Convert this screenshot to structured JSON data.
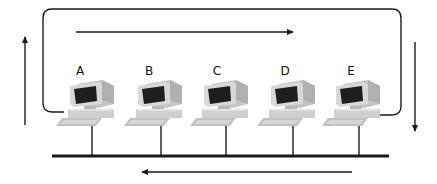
{
  "diagram": {
    "type": "token-ring-over-bus",
    "nodes": [
      {
        "label": "A",
        "cx": 92
      },
      {
        "label": "B",
        "cx": 160
      },
      {
        "label": "C",
        "cx": 226
      },
      {
        "label": "D",
        "cx": 293
      },
      {
        "label": "E",
        "cx": 358
      }
    ],
    "arrows": {
      "top": "right",
      "right": "down",
      "bottom": "left",
      "left": "up"
    },
    "colors": {
      "line": "#1a1a1a",
      "monitor_body": "#d6d6d6",
      "monitor_shade": "#a8a8a8",
      "screen": "#1e1e1e",
      "keyboard": "#c8c8c8"
    }
  }
}
